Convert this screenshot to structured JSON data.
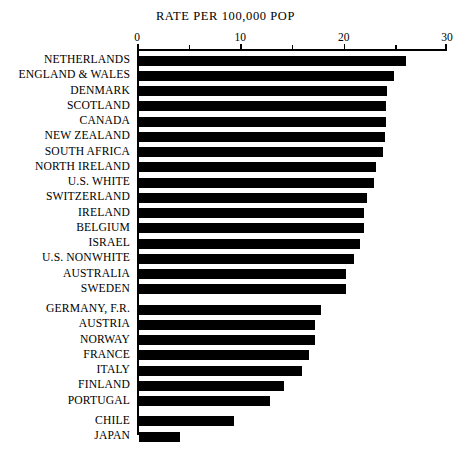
{
  "chart_data": {
    "type": "bar",
    "orientation": "horizontal",
    "title": "RATE PER 100,000 POP",
    "xlabel": "",
    "ylabel": "",
    "xlim": [
      0,
      30
    ],
    "xticks": [
      0,
      10,
      20,
      30
    ],
    "xtick_labels": [
      "0",
      "10",
      "20",
      "30"
    ],
    "minor_xticks": [
      5,
      15,
      25
    ],
    "grid": false,
    "legend": false,
    "bar_color": "#000000",
    "categories": [
      "NETHERLANDS",
      "ENGLAND & WALES",
      "DENMARK",
      "SCOTLAND",
      "CANADA",
      "NEW ZEALAND",
      "SOUTH AFRICA",
      "NORTH IRELAND",
      "U.S. WHITE",
      "SWITZERLAND",
      "IRELAND",
      "BELGIUM",
      "ISRAEL",
      "U.S. NONWHITE",
      "AUSTRALIA",
      "SWEDEN",
      "GERMANY, F.R.",
      "AUSTRIA",
      "NORWAY",
      "FRANCE",
      "ITALY",
      "FINLAND",
      "PORTUGAL",
      "CHILE",
      "JAPAN"
    ],
    "values": [
      25.9,
      24.7,
      24.0,
      23.9,
      23.9,
      23.8,
      23.7,
      23.0,
      22.8,
      22.1,
      21.8,
      21.8,
      21.4,
      20.8,
      20.1,
      20.1,
      17.7,
      17.1,
      17.1,
      16.5,
      15.8,
      14.1,
      12.7,
      9.2,
      4.0
    ],
    "group_breaks_before": [
      "GERMANY, F.R.",
      "CHILE"
    ]
  }
}
